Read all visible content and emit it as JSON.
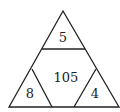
{
  "diagram": {
    "type": "triangle-number-puzzle",
    "regions": {
      "top": "5",
      "center": "105",
      "bottom_left": "8",
      "bottom_right": "4"
    },
    "stroke_color": "#222222",
    "background": "#ffffff"
  }
}
